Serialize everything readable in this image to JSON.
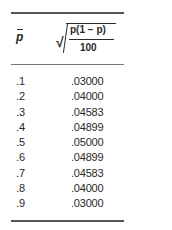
{
  "table": {
    "header": {
      "col1": "p",
      "col2_numerator": "p(1 − p)",
      "col2_denominator": "100",
      "col2_description": "sqrt(p-hat(1 - p-hat)/100)"
    },
    "rows": [
      {
        "p": ".1",
        "value": ".03000"
      },
      {
        "p": ".2",
        "value": ".04000"
      },
      {
        "p": ".3",
        "value": ".04583"
      },
      {
        "p": ".4",
        "value": ".04899"
      },
      {
        "p": ".5",
        "value": ".05000"
      },
      {
        "p": ".6",
        "value": ".04899"
      },
      {
        "p": ".7",
        "value": ".04583"
      },
      {
        "p": ".8",
        "value": ".04000"
      },
      {
        "p": ".9",
        "value": ".03000"
      }
    ]
  }
}
